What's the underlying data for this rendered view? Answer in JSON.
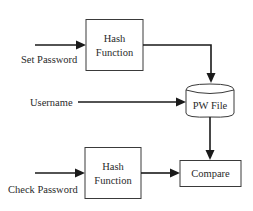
{
  "diagram": {
    "title": "",
    "nodes": {
      "hash_top": {
        "line1": "Hash",
        "line2": "Function"
      },
      "hash_bottom": {
        "line1": "Hash",
        "line2": "Function"
      },
      "pw_file": {
        "label": "PW File"
      },
      "compare": {
        "label": "Compare"
      }
    },
    "inputs": {
      "set_password": "Set Password",
      "username": "Username",
      "check_password": "Check Password"
    },
    "edges": [
      {
        "from": "Set Password",
        "to": "Hash Function (top)"
      },
      {
        "from": "Hash Function (top)",
        "to": "PW File"
      },
      {
        "from": "Username",
        "to": "PW File"
      },
      {
        "from": "PW File",
        "to": "Compare"
      },
      {
        "from": "Check Password",
        "to": "Hash Function (bottom)"
      },
      {
        "from": "Hash Function (bottom)",
        "to": "Compare"
      }
    ],
    "colors": {
      "stroke": "#1a1a1a",
      "box_border": "#3a3a3a",
      "text": "#2a2a2a",
      "background": "#ffffff"
    }
  }
}
